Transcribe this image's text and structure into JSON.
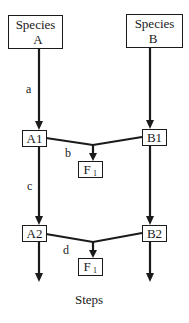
{
  "diagram": {
    "type": "flow-diagram",
    "nodes": {
      "species_a": {
        "line1": "Species",
        "line2": "A"
      },
      "species_b": {
        "line1": "Species",
        "line2": "B"
      },
      "a1": {
        "label": "A1"
      },
      "b1": {
        "label": "B1"
      },
      "f1_top": {
        "label": "F",
        "subscript": "1"
      },
      "a2": {
        "label": "A2"
      },
      "b2": {
        "label": "B2"
      },
      "f1_bottom": {
        "label": "F",
        "subscript": "1"
      }
    },
    "edge_labels": {
      "a": "a",
      "b": "b",
      "c": "c",
      "d": "d"
    },
    "footer": "Steps",
    "colors": {
      "stroke": "#1a1a1a",
      "background": "#ffffff"
    }
  }
}
